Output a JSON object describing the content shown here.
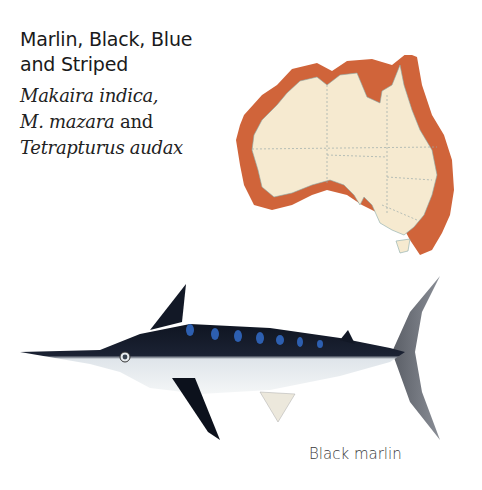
{
  "heading": {
    "line1": "Marlin, Black, Blue",
    "line2": "and Striped"
  },
  "scientific_names": {
    "line1_italic": "Makaira indica,",
    "line2_italic": "M. mazara",
    "line2_plain": " and",
    "line3_italic": "Tetrapturus audax"
  },
  "map": {
    "region": "Australia",
    "distribution_color": "#d0643a",
    "land_color": "#f6ead0",
    "icon": "australia-distribution-map"
  },
  "illustration": {
    "subject": "Black marlin",
    "icon": "marlin-fish-illustration"
  },
  "caption": "Black marlin"
}
